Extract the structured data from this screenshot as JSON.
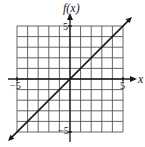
{
  "chart_data": {
    "type": "line",
    "title": "",
    "xlabel": "x",
    "ylabel": "f(x)",
    "xlim": [
      -5,
      5
    ],
    "ylim": [
      -5,
      5
    ],
    "grid": true,
    "legend": null,
    "x_tick_labels": [
      "-5",
      "5"
    ],
    "y_tick_labels": [
      "5",
      "-5"
    ],
    "series": [
      {
        "name": "f(x) = x",
        "x": [
          -6,
          -5,
          -4,
          -3,
          -2,
          -1,
          0,
          1,
          2,
          3,
          4,
          5,
          6
        ],
        "y": [
          -6,
          -5,
          -4,
          -3,
          -2,
          -1,
          0,
          1,
          2,
          3,
          4,
          5,
          6
        ],
        "arrows": "both"
      }
    ],
    "colors": {
      "line": "#1a1a1a",
      "grid": "#555555",
      "axes": "#1a1a1a",
      "background": "#ffffff"
    }
  },
  "labels": {
    "y_axis": "f(x)",
    "x_axis": "x",
    "x_min": "−5",
    "x_max": "5",
    "y_max": "5",
    "y_min": "−5"
  }
}
